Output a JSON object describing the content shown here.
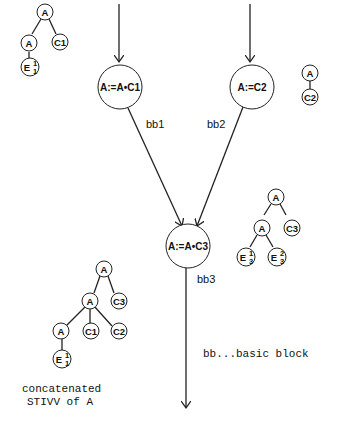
{
  "blocks": {
    "bb1": {
      "label": "bb1",
      "statement": "A:=A•C1"
    },
    "bb2": {
      "label": "bb2",
      "statement": "A:=C2"
    },
    "bb3": {
      "label": "bb3",
      "statement": "A:=A•C3"
    }
  },
  "trees": {
    "tree1": {
      "root": "A",
      "left": "A",
      "right": "C1",
      "leaf": "E",
      "leaf_sup": "1",
      "leaf_sub": "1"
    },
    "tree2": {
      "root": "A",
      "child": "C2"
    },
    "tree3": {
      "root": "A",
      "left": "A",
      "right": "C3",
      "leaf1": "E",
      "leaf1_sup": "1",
      "leaf1_sub": "3",
      "leaf2": "E",
      "leaf2_sup": "2",
      "leaf2_sub": "3"
    },
    "tree4": {
      "root": "A",
      "mid": "A",
      "mid_right": "C3",
      "low": "A",
      "low_c1": "C1",
      "low_c2": "C2",
      "leaf": "E",
      "leaf_sup": "1",
      "leaf_sub": "1"
    }
  },
  "legend": "bb...basic block",
  "caption": {
    "line1": "concatenated",
    "line2": "STIVV of A"
  }
}
